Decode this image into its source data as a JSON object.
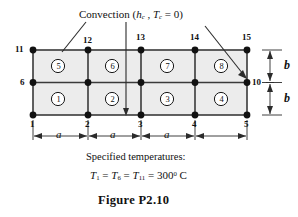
{
  "figure": {
    "caption": "Figure P2.10",
    "convection_label": {
      "prefix": "Convection (",
      "h_symbol": "h",
      "h_sub": "c",
      "separator": " , ",
      "t_symbol": "T",
      "t_sub": "c",
      "equals": " = 0)"
    },
    "specified_temperatures_title": "Specified temperatures:",
    "temperature_equation": {
      "t1": "T",
      "t1_sub": "1",
      "eq1": "=",
      "t6": "T",
      "t6_sub": "6",
      "eq2": "=",
      "t11": "T",
      "t11_sub": "11",
      "eq3": "=",
      "value": "300",
      "degree": "0",
      "unit": "C"
    },
    "mesh": {
      "node_labels": {
        "n1": "1",
        "n2": "2",
        "n3": "3",
        "n4": "4",
        "n5": "5",
        "n6": "6",
        "n10": "10",
        "n11": "11",
        "n12": "12",
        "n13": "13",
        "n14": "14",
        "n15": "15"
      },
      "element_labels": {
        "e1": "1",
        "e2": "2",
        "e3": "3",
        "e4": "4",
        "e5": "5",
        "e6": "6",
        "e7": "7",
        "e8": "8"
      },
      "dimension_labels": {
        "a1": "a",
        "a2": "a",
        "a3": "a",
        "b_top": "b",
        "b_bottom": "b"
      }
    },
    "colors": {
      "line": "#3a3a3a",
      "fill": "#ececec",
      "node": "#111111",
      "text": "#111111",
      "background": "#ffffff"
    }
  }
}
